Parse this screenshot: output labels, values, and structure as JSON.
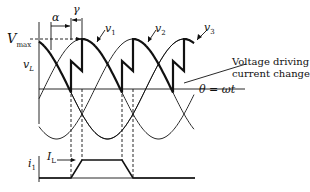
{
  "labels": {
    "alpha": "α",
    "gamma": "γ",
    "vmax": "V",
    "vmax_sub": "max",
    "vL": "v",
    "vL_sub": "L",
    "v1": "v",
    "v1_sub": "1",
    "v2": "v",
    "v2_sub": "2",
    "v3": "v",
    "v3_sub": "3",
    "annotation_line1": "Voltage driving",
    "annotation_line2": "current change",
    "theta": "θ = ωt",
    "i1": "i",
    "i1_sub": "1",
    "IL": "I",
    "IL_sub": "L"
  },
  "colors": {
    "ink": "#111111",
    "background": "#ffffff"
  }
}
